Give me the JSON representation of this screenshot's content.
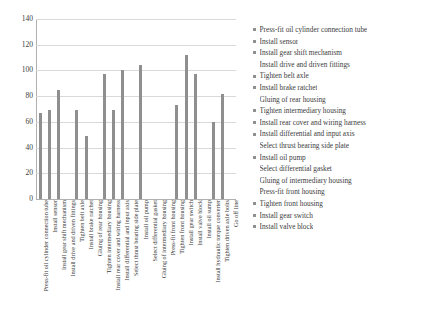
{
  "chart_data": {
    "type": "bar",
    "title": "",
    "xlabel": "",
    "ylabel": "",
    "ylim": [
      0,
      140
    ],
    "yticks": [
      0,
      20,
      40,
      60,
      80,
      100,
      120,
      140
    ],
    "grid": true,
    "legend_position": "right",
    "bar_color": "#8f8f8f",
    "categories": [
      "Press-fit oil cylinder connection tube",
      "Install sensor",
      "Install gear shift mechanism",
      "Install drive and driven fittings",
      "Tighten belt axle",
      "Install brake ratchet",
      "Gluing of rear housing",
      "Tighten intermediary housing",
      "Install rear cover and wiring harness",
      "Install differential and input axis",
      "Select thrust bearing side plate",
      "Install oil pump",
      "Select differential gasket",
      "Gluing of intermediary housing",
      "Press-fit front housing",
      "Tighten front housing",
      "Install gear switch",
      "Install valve block",
      "Install oil sump",
      "Install hydraulic torque converter",
      "Tighten driven axle bolts",
      "Go off line"
    ],
    "values": [
      67,
      69,
      85,
      0,
      69,
      49,
      0,
      97,
      69,
      100,
      0,
      104,
      0,
      0,
      0,
      73,
      112,
      97,
      0,
      60,
      82,
      0
    ]
  },
  "legend": {
    "items": [
      {
        "label": "Press-fit oil cylinder connection tube",
        "marker": true
      },
      {
        "label": "Install sensor",
        "marker": true
      },
      {
        "label": "Install gear shift mechanism",
        "marker": true
      },
      {
        "label": "Install drive and driven fittings",
        "marker": false
      },
      {
        "label": "Tighten belt axle",
        "marker": true
      },
      {
        "label": "Install brake ratchet",
        "marker": true
      },
      {
        "label": "Gluing of rear housing",
        "marker": false
      },
      {
        "label": "Tighten intermediary housing",
        "marker": true
      },
      {
        "label": "Install rear cover and wiring harness",
        "marker": true
      },
      {
        "label": "Install differential and input axis",
        "marker": true
      },
      {
        "label": "Select thrust bearing side plate",
        "marker": false
      },
      {
        "label": "Install oil pump",
        "marker": true
      },
      {
        "label": "Select differential gasket",
        "marker": false
      },
      {
        "label": "Gluing of intermediary housing",
        "marker": false
      },
      {
        "label": "Press-fit front housing",
        "marker": false
      },
      {
        "label": "Tighten front housing",
        "marker": true
      },
      {
        "label": "Install gear switch",
        "marker": true
      },
      {
        "label": "Install valve block",
        "marker": true
      }
    ]
  }
}
